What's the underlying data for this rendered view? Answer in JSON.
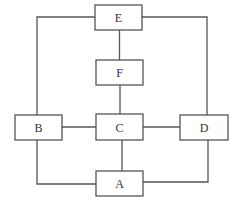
{
  "diagram": {
    "type": "block-diagram",
    "colors": {
      "stroke": "#555555",
      "text": "#333333",
      "background": "#ffffff"
    },
    "nodes": [
      {
        "id": "E",
        "label": "E",
        "x": 95,
        "y": 5,
        "w": 47,
        "h": 25
      },
      {
        "id": "F",
        "label": "F",
        "x": 96,
        "y": 60,
        "w": 47,
        "h": 25
      },
      {
        "id": "B",
        "label": "B",
        "x": 15,
        "y": 115,
        "w": 47,
        "h": 25
      },
      {
        "id": "C",
        "label": "C",
        "x": 96,
        "y": 114,
        "w": 47,
        "h": 26
      },
      {
        "id": "D",
        "label": "D",
        "x": 180,
        "y": 115,
        "w": 48,
        "h": 25
      },
      {
        "id": "A",
        "label": "A",
        "x": 96,
        "y": 171,
        "w": 47,
        "h": 25
      }
    ],
    "edges": [
      {
        "from": "E",
        "to": "F"
      },
      {
        "from": "F",
        "to": "C"
      },
      {
        "from": "E",
        "to": "B"
      },
      {
        "from": "E",
        "to": "D"
      },
      {
        "from": "B",
        "to": "C"
      },
      {
        "from": "C",
        "to": "D"
      },
      {
        "from": "C",
        "to": "A"
      },
      {
        "from": "B",
        "to": "A"
      },
      {
        "from": "D",
        "to": "A"
      }
    ]
  }
}
